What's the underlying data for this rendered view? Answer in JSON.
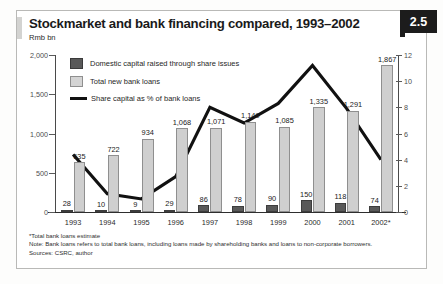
{
  "header": {
    "title": "Stockmarket and bank financing compared, 1993–2002",
    "unit": "Rmb bn",
    "badge": "2.5"
  },
  "legend": {
    "items": [
      {
        "label": "Domestic capital raised through share issues",
        "marker": "dark-swatch",
        "color": "#595959"
      },
      {
        "label": "Total new bank loans",
        "marker": "light-swatch",
        "color": "#cfcfcf"
      },
      {
        "label": "Share capital as % of bank loans",
        "marker": "line",
        "color": "#111111"
      }
    ]
  },
  "footnotes": {
    "line1": "*Total bank loans estimate",
    "line2": "Note: Bank loans refers to total bank loans, including loans made by shareholding banks and loans to non-corporate borrowers.",
    "line3": "Sources: CSRC, author"
  },
  "chart_data": {
    "type": "bar",
    "title": "Stockmarket and bank financing compared, 1993–2002",
    "subtitle": "Rmb bn",
    "xlabel": "",
    "ylabel": "Rmb bn",
    "y2label": "%",
    "ylim": [
      0,
      2000
    ],
    "y2lim": [
      0,
      12
    ],
    "yticks": [
      "0",
      "500",
      "1,000",
      "1,500",
      "2,000"
    ],
    "y2ticks": [
      "0",
      "2",
      "4",
      "6",
      "8",
      "10",
      "12"
    ],
    "grid": false,
    "legend_position": "top-left",
    "categories": [
      "1993",
      "1994",
      "1995",
      "1996",
      "1997",
      "1998",
      "1999",
      "2000",
      "2001",
      "2002*"
    ],
    "series": [
      {
        "name": "Domestic capital raised through share issues",
        "type": "bar",
        "axis": "left",
        "color": "#595959",
        "values": [
          28,
          10,
          9,
          29,
          86,
          78,
          90,
          150,
          118,
          74
        ],
        "labels": [
          "28",
          "10",
          "9",
          "29",
          "86",
          "78",
          "90",
          "150",
          "118",
          "74"
        ]
      },
      {
        "name": "Total new bank loans",
        "type": "bar",
        "axis": "left",
        "color": "#cfcfcf",
        "values": [
          635,
          722,
          934,
          1068,
          1071,
          1149,
          1085,
          1335,
          1291,
          1867
        ],
        "labels": [
          "635",
          "722",
          "934",
          "1,068",
          "1,071",
          "1,149",
          "1,085",
          "1,335",
          "1,291",
          "1,867"
        ]
      },
      {
        "name": "Share capital as % of bank loans",
        "type": "line",
        "axis": "right",
        "color": "#111111",
        "values": [
          4.4,
          1.4,
          1.0,
          2.7,
          8.0,
          6.8,
          8.3,
          11.2,
          7.9,
          4.0
        ]
      }
    ]
  }
}
